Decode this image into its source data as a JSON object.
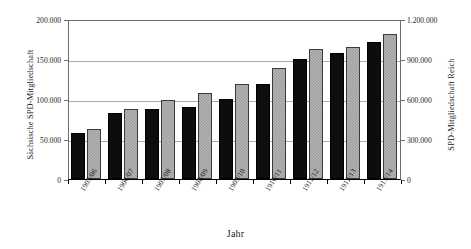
{
  "chart_data": {
    "type": "bar",
    "title": "",
    "subtitle": "",
    "xlabel": "Jahr",
    "ylabel": "Sächsische SPD-Mitgliedschaft",
    "ylabel_right": "SPD-Mitgliedschaft Reich",
    "categories": [
      "1905/06",
      "1906/07",
      "1907/08",
      "1908/09",
      "1909/10",
      "1910/11",
      "1911/12",
      "1912/13",
      "1913/14"
    ],
    "series": [
      {
        "name": "Sächsische SPD-Mitgliedschaft",
        "axis": "left",
        "color": "#0d0d0d",
        "values": [
          58000,
          82000,
          87000,
          90000,
          100000,
          119000,
          150000,
          158000,
          171000
        ]
      },
      {
        "name": "SPD-Mitgliedschaft Reich",
        "axis": "right",
        "color": "#9b9b9b",
        "values": [
          378000,
          528000,
          594000,
          642000,
          714000,
          834000,
          978000,
          990000,
          1086000
        ]
      }
    ],
    "ylim": [
      0,
      200000
    ],
    "ylim_right": [
      0,
      1200000
    ],
    "yticks_left": [
      "0",
      "50.000",
      "100.000",
      "150.000",
      "200.000"
    ],
    "yticks_right": [
      "0",
      "300.000",
      "600.000",
      "900.000",
      "1.200.000"
    ],
    "ytick_values_left": [
      0,
      50000,
      100000,
      150000,
      200000
    ],
    "ytick_values_right": [
      0,
      300000,
      600000,
      900000,
      1200000
    ],
    "grid": true,
    "legend": "none",
    "legend_position": "none"
  }
}
